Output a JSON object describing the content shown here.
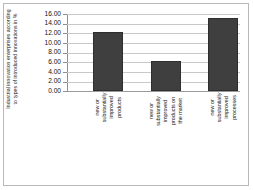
{
  "chart_data": {
    "type": "bar",
    "title": "",
    "subtitle": "",
    "xlabel": "",
    "ylabel": "Industrial innovation enterprises according to types of introduced innovations in %",
    "categories": [
      "new or substantially improved products",
      "new or substantially improved products on the market",
      "new or substantially improved processes"
    ],
    "values": [
      12.3,
      6.3,
      15.2
    ],
    "ylim": [
      0.0,
      16.0
    ],
    "ytick_values": [
      0.0,
      2.0,
      4.0,
      6.0,
      8.0,
      10.0,
      12.0,
      14.0,
      16.0
    ],
    "ytick_labels": [
      "0.00",
      "2.00",
      "4.00",
      "6.00",
      "8.00",
      "10.00",
      "12.00",
      "14.00",
      "16.00"
    ],
    "grid": true,
    "legend": false,
    "legend_position": "none",
    "series": [
      {
        "name": "Industrial innovation enterprises",
        "values": [
          12.3,
          6.3,
          15.2
        ],
        "color": "#3f3f3f"
      }
    ],
    "bar_color": "#3f3f3f",
    "bar_edge_color": "#2e2e2e",
    "gridline_color": "#c9c9c9",
    "axis_color": "#8f8f8f",
    "frame_color": "#b9b9b9",
    "background_color": "#ffffff"
  }
}
